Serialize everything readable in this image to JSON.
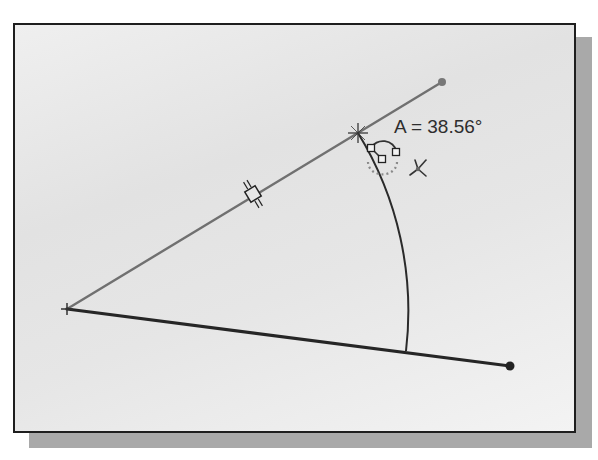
{
  "sketch": {
    "angle_dimension": {
      "label": "A = 38.56°",
      "value_deg": 38.56
    },
    "colors": {
      "frame_border": "#1e1e1e",
      "shadow": "#a9a9a9",
      "construction_line": "#707070",
      "solid_line": "#262626",
      "arc": "#2a2a2a",
      "text": "#2e2e2e"
    },
    "icons": {
      "vertex_marker": "plus-marker",
      "intersection_marker": "cross-snap-marker",
      "midpoint_marker": "midpoint-square-marker",
      "tangent_constraint": "tangent-constraint-glyph",
      "cursor_glyph": "x-pointer-glyph",
      "endpoint": "filled-dot"
    }
  }
}
